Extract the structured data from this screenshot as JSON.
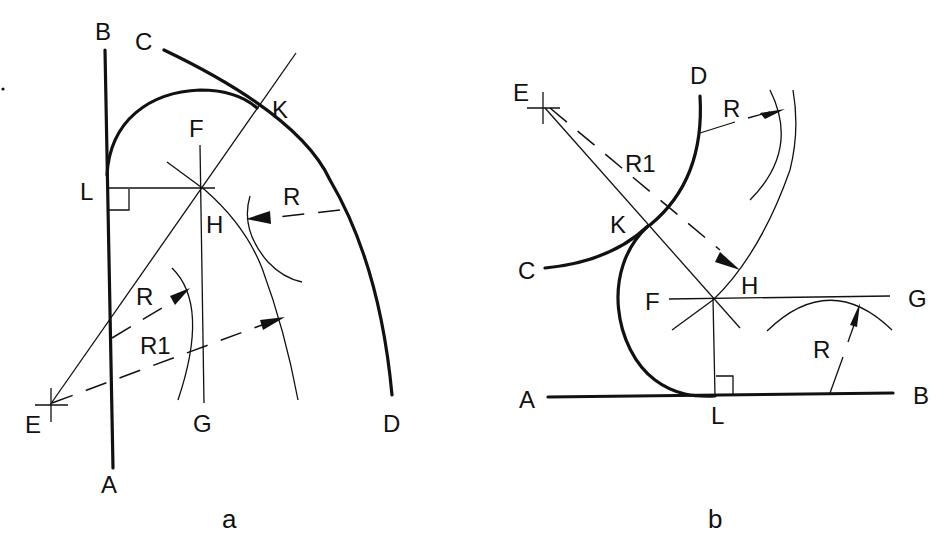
{
  "figure": {
    "panels": [
      {
        "id": "a",
        "caption": "a",
        "labels": {
          "B": "B",
          "C": "C",
          "K": "K",
          "F": "F",
          "L": "L",
          "H": "H",
          "R_outer": "R",
          "R_inner": "R",
          "R1": "R1",
          "E": "E",
          "G": "G",
          "D": "D",
          "A": "A"
        }
      },
      {
        "id": "b",
        "caption": "b",
        "labels": {
          "E": "E",
          "D": "D",
          "R_top": "R",
          "R1": "R1",
          "K": "K",
          "H": "H",
          "C": "C",
          "F": "F",
          "G": "G",
          "R_bottom": "R",
          "A": "A",
          "L": "L",
          "B": "B"
        }
      }
    ],
    "colors": {
      "ink": "#111111",
      "background": "#ffffff"
    }
  }
}
